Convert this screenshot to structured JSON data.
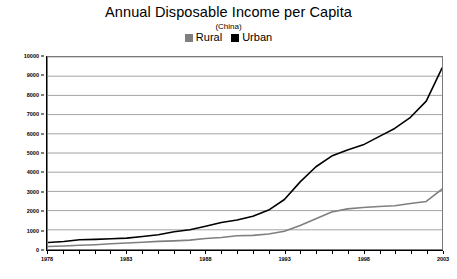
{
  "chart_data": {
    "type": "line",
    "title": "Annual Disposable Income per Capita",
    "subtitle": "(China)",
    "xlabel": "",
    "ylabel": "",
    "grid": true,
    "legend_position": "top",
    "xlim": [
      1978,
      2003
    ],
    "ylim": [
      0,
      10000
    ],
    "y_ticks": [
      0,
      1000,
      2000,
      3000,
      4000,
      5000,
      6000,
      7000,
      8000,
      9000,
      10000
    ],
    "y_tick_labels": [
      "0",
      "1000",
      "2000",
      "3000",
      "4000",
      "5000",
      "6000",
      "7000",
      "8000",
      "9000",
      "10000"
    ],
    "x_tick_labels": [
      "1978",
      "1983",
      "1988",
      "1993",
      "1998",
      "2003"
    ],
    "x": [
      1978,
      1979,
      1980,
      1981,
      1982,
      1983,
      1984,
      1985,
      1986,
      1987,
      1988,
      1989,
      1990,
      1991,
      1992,
      1993,
      1994,
      1995,
      1996,
      1997,
      1998,
      1999,
      2000,
      2001,
      2002,
      2003
    ],
    "series": [
      {
        "name": "Rural",
        "color": "#7f7f7f",
        "values": [
          134,
          160,
          191,
          223,
          270,
          310,
          355,
          398,
          424,
          463,
          545,
          602,
          686,
          709,
          784,
          922,
          1221,
          1578,
          1926,
          2090,
          2162,
          2210,
          2253,
          2366,
          2476,
          3118
        ]
      },
      {
        "name": "Urban",
        "color": "#000000",
        "values": [
          343,
          387,
          478,
          500,
          535,
          565,
          652,
          739,
          900,
          1002,
          1181,
          1376,
          1510,
          1701,
          2027,
          2577,
          3496,
          4283,
          4839,
          5160,
          5425,
          5854,
          6280,
          6860,
          7703,
          9422
        ]
      }
    ]
  },
  "legend": {
    "entries": [
      {
        "label": "Rural",
        "color": "#7f7f7f"
      },
      {
        "label": "Urban",
        "color": "#000000"
      }
    ]
  }
}
